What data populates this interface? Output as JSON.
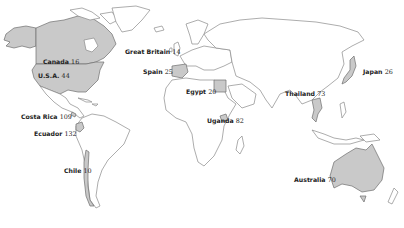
{
  "map": {
    "type": "world-outline-choropleth",
    "highlight_color": "#c9c9c9",
    "outline_color": "#8a8a8a",
    "background": "#ffffff"
  },
  "labels": [
    {
      "country": "Canada",
      "value": "16"
    },
    {
      "country": "U.S.A.",
      "value": "44"
    },
    {
      "country": "Great Britain",
      "value": "14"
    },
    {
      "country": "Spain",
      "value": "25"
    },
    {
      "country": "Egypt",
      "value": "20"
    },
    {
      "country": "Costa Rica",
      "value": "109"
    },
    {
      "country": "Ecuador",
      "value": "132"
    },
    {
      "country": "Uganda",
      "value": "82"
    },
    {
      "country": "Thailand",
      "value": "73"
    },
    {
      "country": "Japan",
      "value": "26"
    },
    {
      "country": "Chile",
      "value": "10"
    },
    {
      "country": "Australia",
      "value": "70"
    }
  ]
}
